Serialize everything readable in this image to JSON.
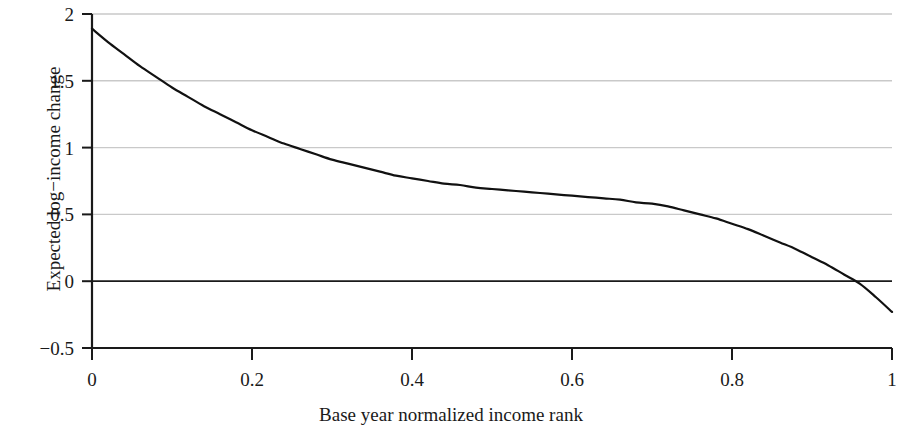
{
  "chart_data": {
    "type": "line",
    "title": "",
    "xlabel": "Base year normalized income rank",
    "ylabel": "Expected log−income change",
    "xlim": [
      0,
      1
    ],
    "ylim": [
      -0.5,
      2
    ],
    "xticks": [
      0,
      0.2,
      0.4,
      0.6,
      0.8,
      1
    ],
    "xtick_labels": [
      "0",
      "0.2",
      "0.4",
      "0.6",
      "0.8",
      "1"
    ],
    "yticks": [
      -0.5,
      0,
      0.5,
      1,
      1.5,
      2
    ],
    "ytick_labels": [
      "−0.5",
      "0",
      "0.5",
      "1",
      "1.5",
      "2"
    ],
    "grid": "horizontal",
    "grid_color": "#c9c9c9",
    "zero_line": true,
    "zero_line_color": "#1a1a1a",
    "legend": null,
    "series": [
      {
        "name": "Expected log-income change",
        "color": "#111111",
        "line_width": 2.2,
        "x": [
          0.0,
          0.02,
          0.04,
          0.06,
          0.08,
          0.1,
          0.12,
          0.14,
          0.16,
          0.18,
          0.2,
          0.22,
          0.24,
          0.26,
          0.28,
          0.3,
          0.32,
          0.34,
          0.36,
          0.38,
          0.4,
          0.42,
          0.44,
          0.46,
          0.48,
          0.5,
          0.52,
          0.54,
          0.56,
          0.58,
          0.6,
          0.62,
          0.64,
          0.66,
          0.68,
          0.7,
          0.72,
          0.74,
          0.76,
          0.78,
          0.8,
          0.82,
          0.84,
          0.86,
          0.88,
          0.9,
          0.92,
          0.94,
          0.96,
          0.98,
          1.0
        ],
        "y": [
          1.89,
          1.79,
          1.7,
          1.61,
          1.53,
          1.45,
          1.38,
          1.31,
          1.25,
          1.19,
          1.13,
          1.08,
          1.03,
          0.99,
          0.95,
          0.91,
          0.88,
          0.85,
          0.82,
          0.79,
          0.77,
          0.75,
          0.73,
          0.72,
          0.7,
          0.69,
          0.68,
          0.67,
          0.66,
          0.65,
          0.64,
          0.63,
          0.62,
          0.61,
          0.59,
          0.58,
          0.56,
          0.53,
          0.5,
          0.47,
          0.43,
          0.39,
          0.34,
          0.29,
          0.24,
          0.18,
          0.12,
          0.05,
          -0.02,
          -0.12,
          -0.23
        ]
      }
    ],
    "annotations": []
  },
  "axes": {
    "x_title": "Base year normalized income rank",
    "y_title": "Expected log−income change",
    "x_tick_labels": [
      "0",
      "0.2",
      "0.4",
      "0.6",
      "0.8",
      "1"
    ],
    "y_tick_labels": [
      "2",
      "1.5",
      "1",
      "0.5",
      "0",
      "−0.5"
    ]
  }
}
